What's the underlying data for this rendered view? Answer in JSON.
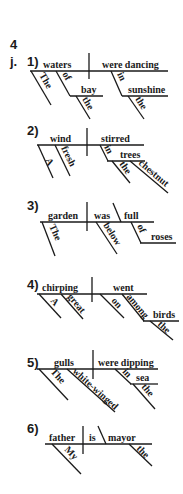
{
  "header": {
    "page_number": "4",
    "exercise_letter": "j."
  },
  "diagrams": [
    {
      "number": "1)",
      "subject": "waters",
      "predicate": "were dancing",
      "modifiers": {
        "subj_article": "The",
        "prep1": "of",
        "prep1_object": "bay",
        "prep1_obj_article": "the",
        "prep2": "in",
        "prep2_object": "sunshine",
        "prep2_obj_article": "the"
      }
    },
    {
      "number": "2)",
      "subject": "wind",
      "predicate": "stirred",
      "modifiers": {
        "subj_article": "A",
        "subj_adj": "fresh",
        "prep": "in",
        "prep_object": "trees",
        "obj_article": "the",
        "obj_adj": "chestnut"
      }
    },
    {
      "number": "3)",
      "subject": "garden",
      "verb": "was",
      "complement": "full",
      "modifiers": {
        "subj_article": "The",
        "adverb": "below",
        "prep": "of",
        "prep_object": "roses"
      }
    },
    {
      "number": "4)",
      "subject": "chirping",
      "predicate": "went",
      "modifiers": {
        "subj_article": "A",
        "subj_adj": "great",
        "adverb": "on",
        "prep": "among",
        "prep_object": "birds",
        "obj_article": "the"
      }
    },
    {
      "number": "5)",
      "subject": "gulls",
      "predicate": "were dipping",
      "modifiers": {
        "subj_article": "The",
        "subj_adj": "white-winged",
        "prep": "in",
        "prep_object": "sea",
        "obj_article": "the"
      }
    },
    {
      "number": "6)",
      "subject": "father",
      "verb": "is",
      "complement": "mayor",
      "modifiers": {
        "subj_article": "My",
        "comp_article": "the"
      }
    }
  ]
}
